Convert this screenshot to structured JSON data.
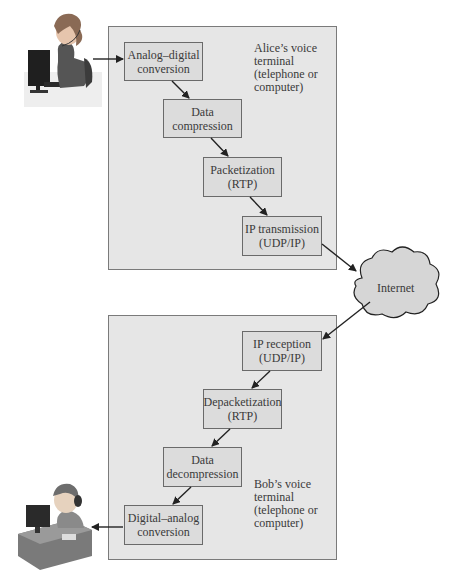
{
  "sender": {
    "name": "Alice",
    "terminal_label": [
      "Alice’s voice",
      "terminal",
      "(telephone or",
      "computer)"
    ],
    "steps": [
      {
        "line1": "Analog–digital",
        "line2": "conversion"
      },
      {
        "line1": "Data",
        "line2": "compression"
      },
      {
        "line1": "Packetization",
        "line2": "(RTP)"
      },
      {
        "line1": "IP transmission",
        "line2": "(UDP/IP)"
      }
    ]
  },
  "network": {
    "label": "Internet"
  },
  "receiver": {
    "name": "Bob",
    "terminal_label": [
      "Bob’s voice",
      "terminal",
      "(telephone or",
      "computer)"
    ],
    "steps": [
      {
        "line1": "IP reception",
        "line2": "(UDP/IP)"
      },
      {
        "line1": "Depacketization",
        "line2": "(RTP)"
      },
      {
        "line1": "Data",
        "line2": "decompression"
      },
      {
        "line1": "Digital–analog",
        "line2": "conversion"
      }
    ]
  },
  "icons": {
    "sender_person": "woman-at-computer-with-headset-icon",
    "receiver_person": "boy-at-desk-with-headset-icon",
    "network": "cloud-icon"
  },
  "colors": {
    "panel_fill": "#e6e6e6",
    "box_fill": "#dcdcdc",
    "cloud_fill": "#d6d6d6",
    "line": "#222222"
  }
}
